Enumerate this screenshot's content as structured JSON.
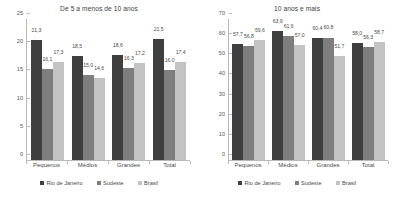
{
  "figure": {
    "series_colors": [
      "#3f3f3f",
      "#7e7e7e",
      "#c3c3c3"
    ],
    "legend": [
      "Rio de Janeiro",
      "Sudeste",
      "Brasil"
    ]
  },
  "chart_data": [
    {
      "type": "bar",
      "title": "De 5 a menos de 10 anos",
      "xlabel": "",
      "ylabel": "",
      "ylim": [
        0,
        25
      ],
      "yticks": [
        0,
        5,
        10,
        15,
        20,
        25
      ],
      "grid": false,
      "legend_position": "bottom",
      "categories": [
        "Pequenos",
        "Médios",
        "Grandes",
        "Total"
      ],
      "series": [
        {
          "name": "Rio de Janeiro",
          "values": [
            21.3,
            18.5,
            18.6,
            21.5
          ]
        },
        {
          "name": "Sudeste",
          "values": [
            16.1,
            15.0,
            16.3,
            16.0
          ]
        },
        {
          "name": "Brasil",
          "values": [
            17.3,
            14.6,
            17.2,
            17.4
          ]
        }
      ],
      "value_labels": [
        [
          "21,3",
          "18,5",
          "18,6",
          "21,5"
        ],
        [
          "16,1",
          "15,0",
          "16,3",
          "16,0"
        ],
        [
          "17,3",
          "14,6",
          "17,2",
          "17,4"
        ]
      ]
    },
    {
      "type": "bar",
      "title": "10 anos e mais",
      "xlabel": "",
      "ylabel": "",
      "ylim": [
        0,
        70
      ],
      "yticks": [
        0,
        10,
        20,
        30,
        40,
        50,
        60,
        70
      ],
      "grid": false,
      "legend_position": "bottom",
      "categories": [
        "Pequenos",
        "Médios",
        "Grandes",
        "Total"
      ],
      "series": [
        {
          "name": "Rio de Janeiro",
          "values": [
            57.7,
            63.9,
            60.4,
            58.0
          ]
        },
        {
          "name": "Sudeste",
          "values": [
            56.8,
            61.6,
            60.8,
            56.3
          ]
        },
        {
          "name": "Brasil",
          "values": [
            59.6,
            57.0,
            51.7,
            58.7
          ]
        }
      ],
      "value_labels": [
        [
          "57,7",
          "63,9",
          "60,4",
          "58,0"
        ],
        [
          "56,8",
          "61,6",
          "60,8",
          "56,3"
        ],
        [
          "59,6",
          "57,0",
          "51,7",
          "58,7"
        ]
      ]
    }
  ]
}
